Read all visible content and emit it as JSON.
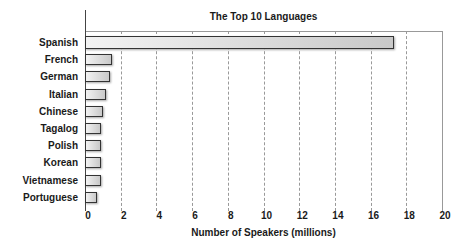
{
  "chart_data": {
    "type": "bar",
    "orientation": "horizontal",
    "title": "The Top 10 Languages",
    "xlabel": "Number of Speakers (millions)",
    "ylabel": "",
    "categories": [
      "Spanish",
      "French",
      "German",
      "Italian",
      "Chinese",
      "Tagalog",
      "Polish",
      "Korean",
      "Vietnamese",
      "Portuguese"
    ],
    "values": [
      17.3,
      1.5,
      1.4,
      1.2,
      1.0,
      0.9,
      0.9,
      0.9,
      0.9,
      0.7
    ],
    "xlim": [
      0,
      20
    ],
    "xticks": [
      "0",
      "2",
      "4",
      "6",
      "8",
      "10",
      "12",
      "14",
      "16",
      "18",
      "20"
    ],
    "grid": "vertical dashed",
    "legend": "none",
    "bar_color": "#d9d9d9",
    "bar_border": "#333333"
  }
}
